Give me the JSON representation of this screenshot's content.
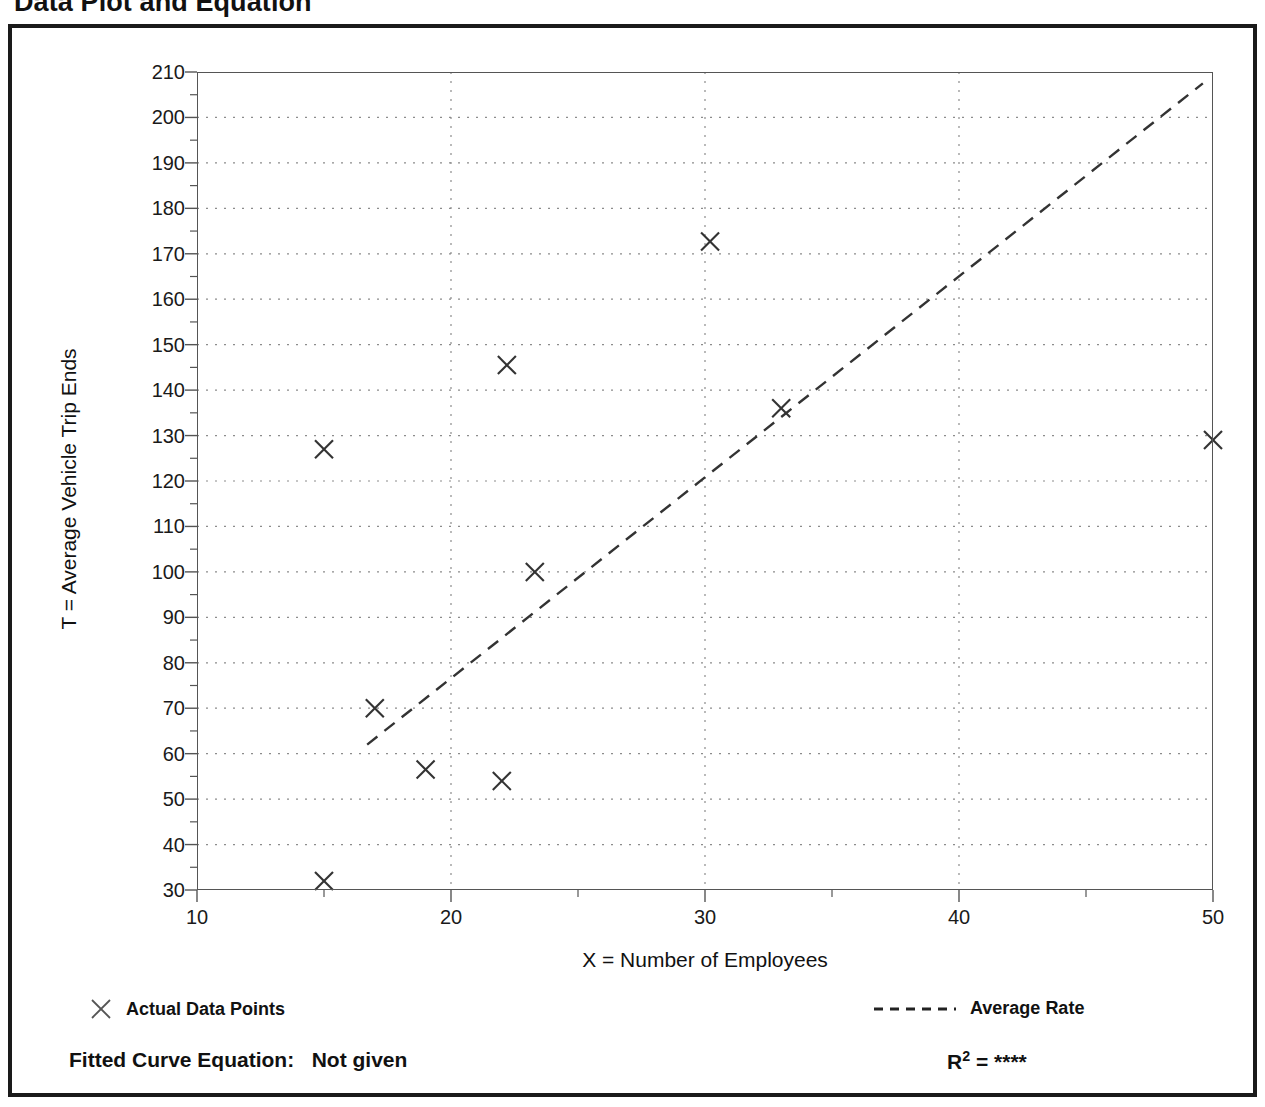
{
  "page": {
    "title": "Data Plot and Equation"
  },
  "footer": {
    "fitted_curve_label": "Fitted Curve Equation:",
    "fitted_curve_value": "Not given",
    "r_squared_label": "R",
    "r_squared_exponent": "2",
    "r_squared_equals": "=",
    "r_squared_value": "****"
  },
  "legend": {
    "entries": [
      {
        "label": "Actual Data Points",
        "marker": "x-marker-icon",
        "style": "marker"
      },
      {
        "label": "Average Rate",
        "marker": "dashed-line-icon",
        "style": "dashed"
      }
    ]
  },
  "colors": {
    "frame": "#1a1a1a",
    "axis": "#555555",
    "grid": "#8c8c8c",
    "marker": "#333333",
    "trend": "#333333",
    "background": "#ffffff"
  },
  "chart_data": {
    "type": "scatter",
    "title": "Data Plot and Equation",
    "xlabel": "X = Number of Employees",
    "ylabel": "T = Average Vehicle Trip Ends",
    "xlim": [
      10,
      50
    ],
    "ylim": [
      30,
      210
    ],
    "grid": true,
    "x_ticks": [
      10,
      20,
      30,
      40,
      50
    ],
    "x_tick_labels": [
      "10",
      "20",
      "30",
      "40",
      "50"
    ],
    "x_minor_ticks": [
      15,
      25,
      35,
      45
    ],
    "y_ticks": [
      30,
      40,
      50,
      60,
      70,
      80,
      90,
      100,
      110,
      120,
      130,
      140,
      150,
      160,
      170,
      180,
      190,
      200,
      210
    ],
    "y_tick_labels": [
      "30",
      "40",
      "50",
      "60",
      "70",
      "80",
      "90",
      "100",
      "110",
      "120",
      "130",
      "140",
      "150",
      "160",
      "170",
      "180",
      "190",
      "200",
      "210"
    ],
    "y_minor_ticks": [
      35,
      45,
      55,
      65,
      75,
      85,
      95,
      105,
      115,
      125,
      135,
      145,
      155,
      165,
      175,
      185,
      195,
      205
    ],
    "legend_position": "below-axes",
    "series": [
      {
        "name": "Actual Data Points",
        "type": "scatter",
        "marker": "x",
        "points": [
          {
            "x": 15.0,
            "y": 32.0
          },
          {
            "x": 15.0,
            "y": 127.0
          },
          {
            "x": 17.0,
            "y": 70.0
          },
          {
            "x": 19.0,
            "y": 56.5
          },
          {
            "x": 22.0,
            "y": 54.0
          },
          {
            "x": 22.2,
            "y": 145.5
          },
          {
            "x": 23.3,
            "y": 100.0
          },
          {
            "x": 30.2,
            "y": 172.7
          },
          {
            "x": 33.0,
            "y": 136.0
          },
          {
            "x": 50.0,
            "y": 129.0
          }
        ]
      },
      {
        "name": "Average Rate",
        "type": "line",
        "style": "dashed",
        "points": [
          {
            "x": 16.7,
            "y": 62.0
          },
          {
            "x": 49.6,
            "y": 207.5
          }
        ]
      }
    ]
  }
}
